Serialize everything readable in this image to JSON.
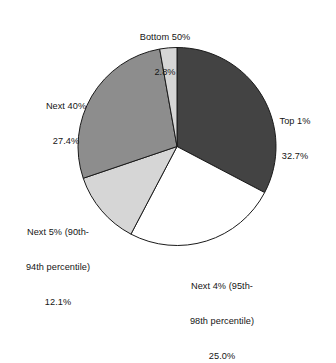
{
  "chart_data": {
    "type": "pie",
    "title": "",
    "subtitle": "",
    "xlabel": "",
    "ylabel": "",
    "legend_position": "none",
    "grid": false,
    "start_angle_deg": 90,
    "direction": "clockwise",
    "total": 100.0,
    "categories": [
      "Top 1%",
      "Next 4% (95th-98th percentile)",
      "Next 5% (90th-94th percentile)",
      "Next 40%",
      "Bottom 50%"
    ],
    "values": [
      32.7,
      25.0,
      12.1,
      27.4,
      2.8
    ],
    "value_labels": [
      "32.7%",
      "25.0%",
      "12.1%",
      "27.4%",
      "2.8%"
    ],
    "colors": [
      "#434343",
      "#ffffff",
      "#d6d6d6",
      "#8d8d8d",
      "#d6d6d6"
    ],
    "slice_outline_color": "#1a1a1a",
    "slices": [
      {
        "name": "Top 1%",
        "value": 32.7,
        "value_label": "32.7%",
        "color": "#434343",
        "label_lines": [
          "Top 1%",
          "32.7%"
        ]
      },
      {
        "name": "Next 4% (95th-98th percentile)",
        "value": 25.0,
        "value_label": "25.0%",
        "color": "#ffffff",
        "label_lines": [
          "Next 4% (95th-",
          "98th percentile)",
          "25.0%"
        ]
      },
      {
        "name": "Next 5% (90th-94th percentile)",
        "value": 12.1,
        "value_label": "12.1%",
        "color": "#d6d6d6",
        "label_lines": [
          "Next 5% (90th-",
          "94th percentile)",
          "12.1%"
        ]
      },
      {
        "name": "Next 40%",
        "value": 27.4,
        "value_label": "27.4%",
        "color": "#8d8d8d",
        "label_lines": [
          "Next 40%",
          "27.4%"
        ]
      },
      {
        "name": "Bottom 50%",
        "value": 2.8,
        "value_label": "2.8%",
        "color": "#d6d6d6",
        "label_lines": [
          "Bottom 50%",
          "2.8%"
        ]
      }
    ]
  },
  "labels": {
    "bottom50": {
      "line1": "Bottom 50%",
      "line2": "2.8%"
    },
    "top1": {
      "line1": "Top 1%",
      "line2": "32.7%"
    },
    "next40": {
      "line1": "Next 40%",
      "line2": "27.4%"
    },
    "next5": {
      "line1": "Next 5% (90th-",
      "line2": "94th percentile)",
      "line3": "12.1%"
    },
    "next4": {
      "line1": "Next 4% (95th-",
      "line2": "98th percentile)",
      "line3": "25.0%"
    }
  }
}
